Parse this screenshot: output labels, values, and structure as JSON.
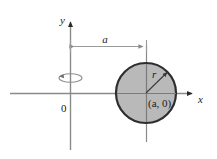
{
  "figure": {
    "type": "diagram",
    "background_color": "#ffffff",
    "axes": {
      "x_axis_label": "x",
      "y_axis_label": "y",
      "origin_label": "0",
      "axis_color": "#8a8a8a",
      "arrow_color": "#2b2b2b"
    },
    "dimension": {
      "label": "a",
      "description": "double-headed dimension arrow from the y-axis to the circle center vertical line",
      "color": "#9a9a9a"
    },
    "circle": {
      "center_label": "(a, 0)",
      "radius_label": "r",
      "fill_color": "#b9b9b9",
      "stroke_color": "#2e2e2e",
      "center_x": 146,
      "center_y": 93,
      "radius": 30
    },
    "rotation_indicator": {
      "description": "ellipse with arrowhead indicating rotation about the y-axis",
      "color": "#8f8f8f"
    }
  }
}
